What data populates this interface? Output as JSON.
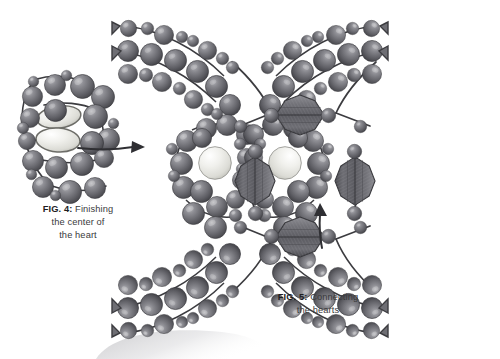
{
  "page": {
    "background": "#ffffff",
    "width": 500,
    "height": 359,
    "kind": "beading-instruction-illustration"
  },
  "figures": [
    {
      "id": "fig4",
      "label": "FIG. 4:",
      "title": "Finishing",
      "line2": "the center of",
      "line3": "the heart",
      "caption_full": "FIG. 4: Finishing the center of the heart",
      "description": "Close-up of a heart made of round beads with two pale lens-shaped beads at its center and a thread arrow exiting to the right"
    },
    {
      "id": "fig5",
      "label": "FIG. 5:",
      "title": "Connecting",
      "line2": "the hearts",
      "caption_full": "FIG. 5: Connecting the hearts",
      "description": "Two beaded hearts joined by faceted rondelle beads, with four beaded straps radiating to the corners, and a thread arrow at lower center"
    }
  ],
  "colors": {
    "bead_dark": "#6b6b70",
    "bead_dark_edge": "#3c3c40",
    "bead_light": "#e9e9e4",
    "bead_light_edge": "#9a9a95",
    "thread": "#3c3c40",
    "caption_text": "#3a3a3c",
    "caption_label": "#1d1d1f",
    "shadow": "#d5d5d7",
    "background": "#ffffff"
  },
  "elements": {
    "arrow_fig4_name": "thread-direction-arrow",
    "arrow_fig5_name": "thread-direction-arrow",
    "bottom_shadow_name": "page-shadow"
  }
}
